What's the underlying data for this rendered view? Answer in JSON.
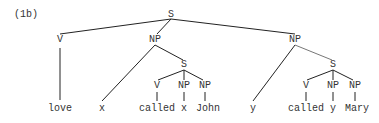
{
  "example_label": "(1b)",
  "nodes": {
    "root": {
      "label": "S",
      "x": 171,
      "y": 13
    },
    "v1": {
      "label": "V",
      "x": 60,
      "y": 35
    },
    "np1": {
      "label": "NP",
      "x": 155,
      "y": 35
    },
    "np2": {
      "label": "NP",
      "x": 295,
      "y": 35
    },
    "s1": {
      "label": "S",
      "x": 184,
      "y": 62
    },
    "s1_v": {
      "label": "V",
      "x": 157,
      "y": 81
    },
    "s1_np1": {
      "label": "NP",
      "x": 184,
      "y": 81
    },
    "s1_np2": {
      "label": "NP",
      "x": 204,
      "y": 81
    },
    "s2": {
      "label": "S",
      "x": 333,
      "y": 62
    },
    "s2_v": {
      "label": "V",
      "x": 306,
      "y": 81
    },
    "s2_np1": {
      "label": "NP",
      "x": 333,
      "y": 81
    },
    "s2_np2": {
      "label": "NP",
      "x": 354,
      "y": 81
    }
  },
  "leaves": {
    "love": {
      "label": "love",
      "x": 60,
      "y": 104
    },
    "x1": {
      "label": "x",
      "x": 102,
      "y": 104
    },
    "called1": {
      "label": "called",
      "x": 157,
      "y": 104
    },
    "x2": {
      "label": "x",
      "x": 184,
      "y": 104
    },
    "john": {
      "label": "John",
      "x": 208,
      "y": 104
    },
    "y1": {
      "label": "y",
      "x": 253,
      "y": 104
    },
    "called2": {
      "label": "called",
      "x": 306,
      "y": 104
    },
    "y2": {
      "label": "y",
      "x": 333,
      "y": 104
    },
    "mary": {
      "label": "Mary",
      "x": 357,
      "y": 104
    }
  },
  "colors": {
    "line": "#222222",
    "text": "#333333"
  }
}
